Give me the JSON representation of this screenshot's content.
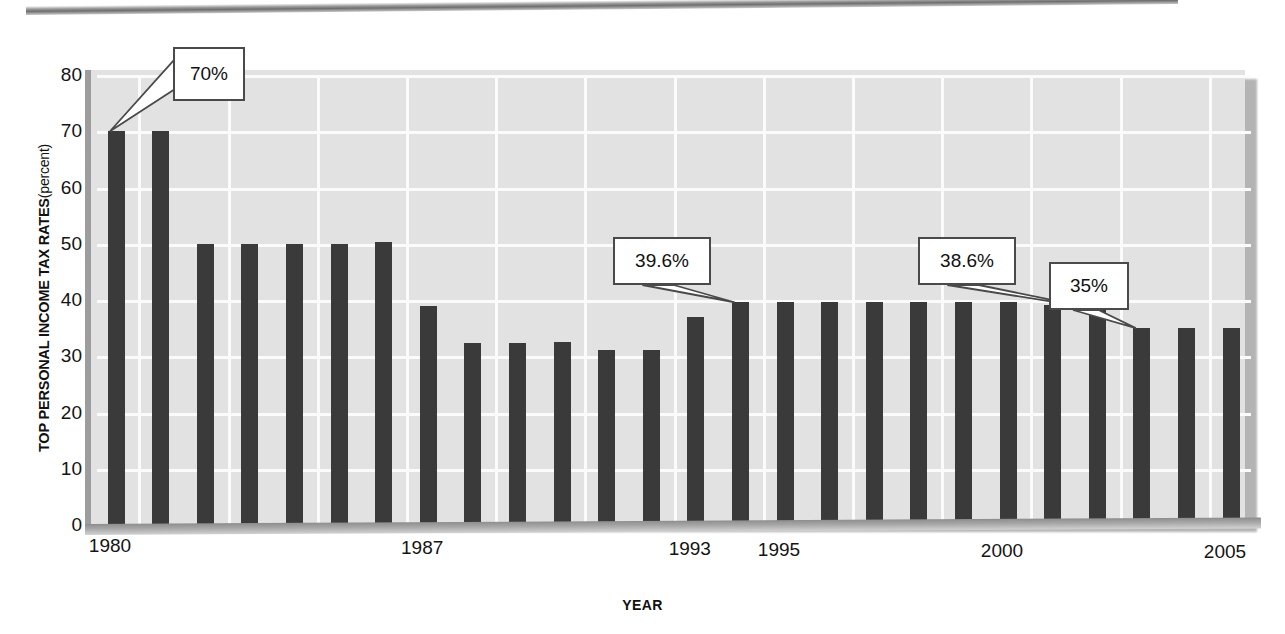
{
  "chart_data": {
    "type": "bar",
    "title": "",
    "subtitle": "",
    "xlabel": "YEAR",
    "ylabel": "TOP PERSONAL INCOME TAX RATES (percent)",
    "ylabel_main": "TOP PERSONAL INCOME TAX RATES",
    "ylabel_unit": "(percent)",
    "ylim": [
      0,
      80
    ],
    "ytick_values": [
      0,
      10,
      20,
      30,
      40,
      50,
      60,
      70,
      80
    ],
    "ytick_labels": [
      "0",
      "10",
      "20",
      "30",
      "40",
      "50",
      "60",
      "70",
      "80"
    ],
    "xtick_labels": [
      "1980",
      "1987",
      "1993",
      "1995",
      "2000",
      "2005"
    ],
    "xtick_years": [
      1980,
      1987,
      1993,
      1995,
      2000,
      2005
    ],
    "grid": true,
    "legend": "none",
    "bar_color": "#3a3a3a",
    "plot_background": "#e2e2e2",
    "gridline_color": "#fbfbfb",
    "categories": [
      "1980",
      "1981",
      "1982",
      "1983",
      "1984",
      "1985",
      "1986",
      "1987",
      "1988",
      "1989",
      "1990",
      "1991",
      "1992",
      "1993",
      "1994",
      "1995",
      "1996",
      "1997",
      "1998",
      "1999",
      "2000",
      "2001",
      "2002",
      "2003",
      "2004",
      "2005"
    ],
    "values": [
      70,
      70,
      50,
      50,
      50,
      50,
      50.3,
      38.9,
      32.4,
      32.4,
      32.5,
      31.1,
      31.1,
      36.9,
      39.6,
      39.6,
      39.6,
      39.6,
      39.6,
      39.6,
      39.6,
      39.1,
      38.6,
      35,
      35,
      35
    ],
    "annotations": [
      {
        "label": "70%",
        "year": "1980",
        "value": 70
      },
      {
        "label": "39.6%",
        "year": "1994",
        "value": 39.6
      },
      {
        "label": "38.6%",
        "year": "2002",
        "value": 38.6
      },
      {
        "label": "35%",
        "year": "2003",
        "value": 35
      }
    ]
  }
}
